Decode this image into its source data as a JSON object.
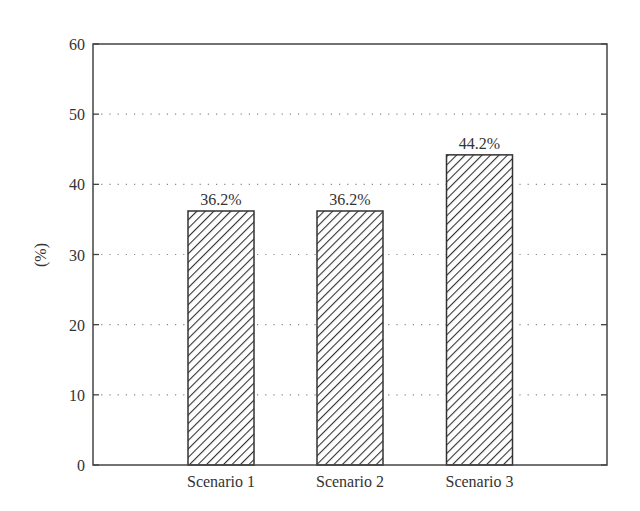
{
  "chart_data": {
    "type": "bar",
    "title": "",
    "xlabel": "",
    "ylabel": "(%)",
    "categories": [
      "Scenario 1",
      "Scenario 2",
      "Scenario 3"
    ],
    "values": [
      36.2,
      36.2,
      44.2
    ],
    "value_labels": [
      "36.2%",
      "36.2%",
      "44.2%"
    ],
    "ylim": [
      0,
      60
    ],
    "yticks": [
      0,
      10,
      20,
      30,
      40,
      50,
      60
    ],
    "grid": {
      "y": true,
      "style": "dotted"
    },
    "legend": null,
    "bar_fill": "diagonal-hatch",
    "colors": {
      "bar_stroke": "#333333",
      "hatch": "#333333",
      "axis": "#444444",
      "grid": "#888888",
      "text": "#333333"
    }
  }
}
